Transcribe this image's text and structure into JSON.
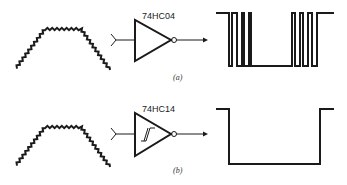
{
  "figure": {
    "panels": [
      {
        "id": "a",
        "label": "(a)",
        "chip": "74HC04",
        "gate_type": "inverter",
        "input_signal": "noisy slow trapezoid pulse",
        "output_signal": "multiple spurious transitions (chatter)"
      },
      {
        "id": "b",
        "label": "(b)",
        "chip": "74HC14",
        "gate_type": "schmitt-trigger inverter",
        "hysteresis_symbol": true,
        "input_signal": "noisy slow trapezoid pulse",
        "output_signal": "single clean inverted pulse"
      }
    ]
  },
  "colors": {
    "ink": "#1a1a1a",
    "background": "#ffffff"
  }
}
